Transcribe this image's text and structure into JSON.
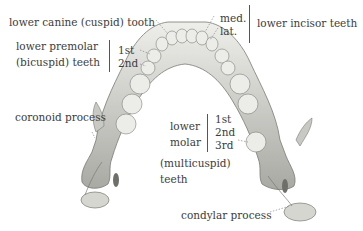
{
  "diagram": {
    "labels": {
      "canine": "lower canine (cuspid) tooth",
      "premolar_line1": "lower premolar",
      "premolar_line2": "(bicuspid) teeth",
      "premolar_1st": "1st",
      "premolar_2nd": "2nd",
      "incisor_med": "med.",
      "incisor_lat": "lat.",
      "incisor": "lower incisor teeth",
      "coronoid": "coronoid process",
      "molar_line1": "lower",
      "molar_line2": "molar",
      "molar_1st": "1st",
      "molar_2nd": "2nd",
      "molar_3rd": "3rd",
      "molar_line3": "(multicuspid)",
      "molar_line4": "teeth",
      "condylar": "condylar process"
    },
    "colors": {
      "bone": "#d9d9d4",
      "bone_shadow": "#8f8f8a",
      "line": "#555555",
      "text": "#3c3c3c"
    }
  }
}
